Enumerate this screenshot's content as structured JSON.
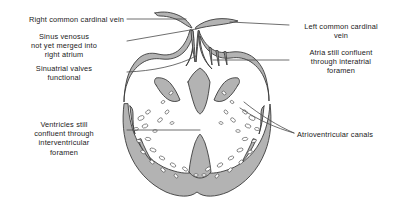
{
  "figure": {
    "type": "anatomical-diagram",
    "colors": {
      "outline": "#3c3c3c",
      "myocardium_fill": "#b3b3b3",
      "lumen_fill": "#ffffff",
      "leader_line": "#4a4a4a",
      "text": "#1a1a1a",
      "background": "#ffffff"
    }
  },
  "labels": {
    "right_common_cardinal_vein": "Right common cardinal vein",
    "sinus_venosus": "Sinus venosus\nnot yet merged into\nright atrium",
    "sinuatrial_valves": "Sinuatrial valves\nfunctional",
    "ventricles_confluent": "Ventricles still\nconfluent through\ninterventricular\nforamen",
    "left_common_cardinal_vein": "Left common cardinal\nvein",
    "atria_confluent": "Atria still confluent\nthrough interatrial\nforamen",
    "atrioventricular_canals": "Atrioventricular canals"
  }
}
